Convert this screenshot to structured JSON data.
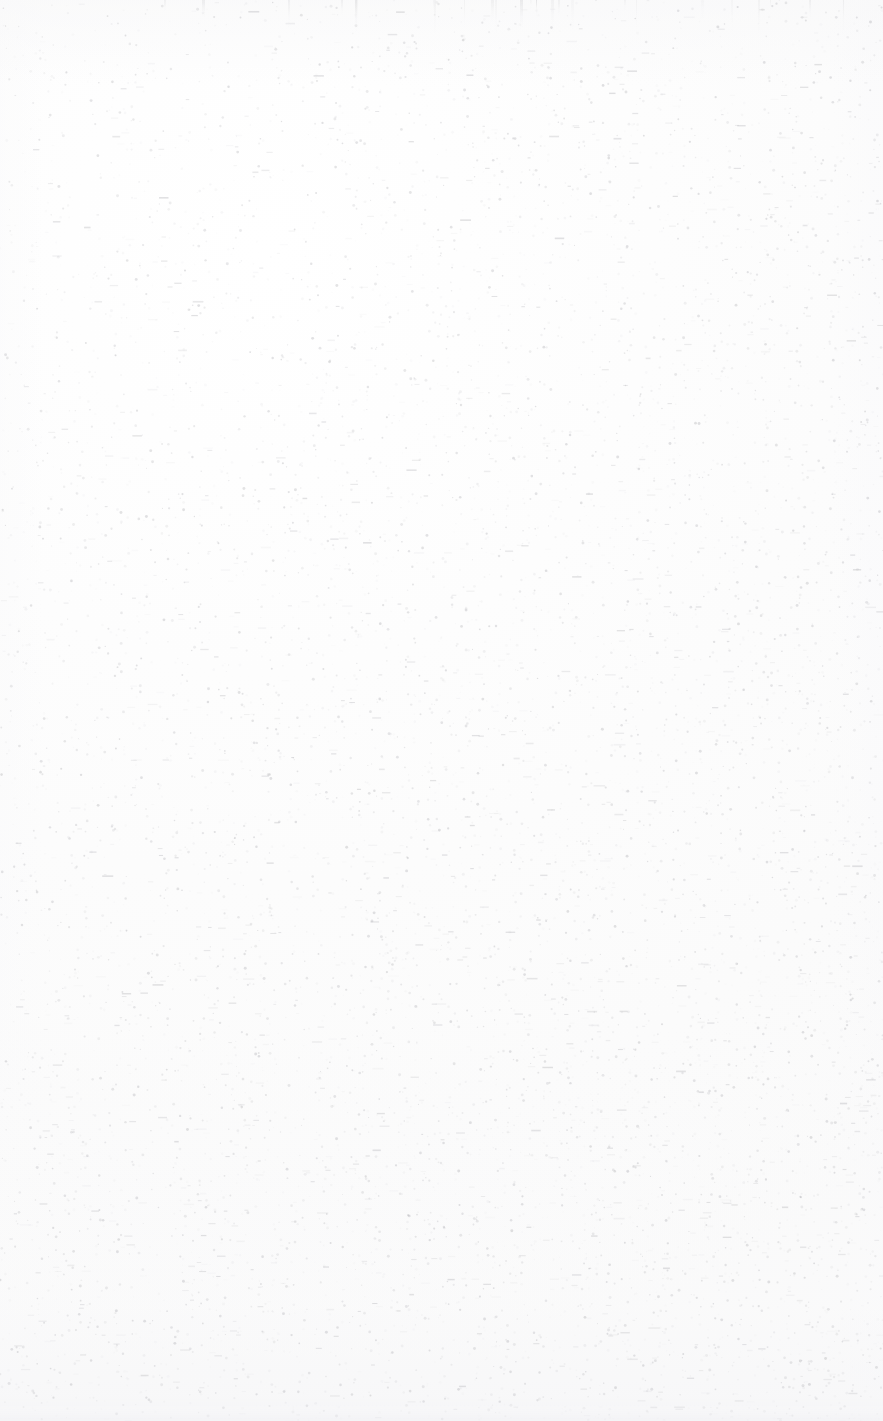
{
  "document": {
    "kind": "scanned-page",
    "page_state": "blank",
    "visible_text": "",
    "page_width_px": 883,
    "page_height_px": 1421,
    "background_color": "#fdfdfd",
    "paper_tint_color": "#f7f7f8",
    "speckle_color": "#9a9aa0",
    "streak_color": "#cdcdd0",
    "bottom_band_color": "#f1f1f4"
  },
  "artifacts": {
    "speckle": {
      "label": "scanner dust speckle",
      "count": 14000,
      "min_opacity": 0.03,
      "max_opacity": 0.3,
      "min_size_px": 1,
      "max_size_px": 3,
      "density_bias": "increases toward lower-right"
    },
    "top_streaks": {
      "label": "vertical scanner streaks at top edge",
      "count": 26,
      "height_px": 34
    },
    "bottom_band": {
      "label": "denser noise band at bottom edge",
      "height_px": 24
    }
  }
}
